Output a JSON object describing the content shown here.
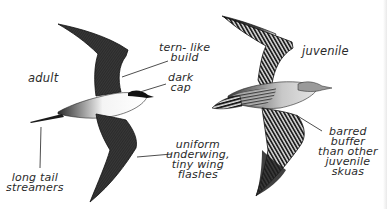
{
  "figure": {
    "colors": {
      "background": "#ffffff",
      "ink": "#1c1c1c",
      "label_text": "#2a2a2a",
      "leader_line": "#3a3a3a",
      "underbody_white": "#f4f4f4"
    }
  },
  "birds": [
    {
      "id": "adult",
      "label": "adult",
      "annotations": [
        {
          "id": "tern-like",
          "lines": [
            "tern- like",
            "build"
          ]
        },
        {
          "id": "dark-cap",
          "lines": [
            "dark",
            "cap"
          ]
        },
        {
          "id": "uniform-underwing",
          "lines": [
            "uniform",
            "underwing,",
            "tiny wing",
            "flashes"
          ]
        },
        {
          "id": "long-tail",
          "lines": [
            "long tail",
            "streamers"
          ]
        }
      ]
    },
    {
      "id": "juvenile",
      "label": "juvenile",
      "annotations": [
        {
          "id": "barred-buffer",
          "lines": [
            "barred",
            "buffer",
            "than other",
            "juvenile",
            "skuas"
          ]
        }
      ]
    }
  ]
}
